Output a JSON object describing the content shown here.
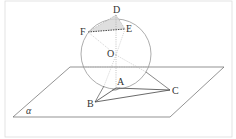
{
  "diagram": {
    "type": "3d-geometry",
    "colors": {
      "stroke": "#555555",
      "hidden": "#9a9a9a",
      "sphere": "#8a8a8a",
      "shade": "#c8c8c8",
      "frame": "#cfcfcf"
    },
    "plane_label": "α",
    "points": {
      "D": {
        "label": "D",
        "x": 116,
        "y": 14
      },
      "E": {
        "label": "E",
        "x": 125,
        "y": 29
      },
      "F": {
        "label": "F",
        "x": 88,
        "y": 32
      },
      "O": {
        "label": "O",
        "x": 116,
        "y": 55
      },
      "A": {
        "label": "A",
        "x": 116,
        "y": 88
      },
      "B": {
        "label": "B",
        "x": 95,
        "y": 102
      },
      "C": {
        "label": "C",
        "x": 170,
        "y": 90
      }
    },
    "sphere": {
      "cx": 116,
      "cy": 54,
      "r": 35
    },
    "plane": {
      "corners": [
        [
          70,
          67
        ],
        [
          224,
          67
        ],
        [
          170,
          117
        ],
        [
          13,
          117
        ]
      ]
    }
  }
}
